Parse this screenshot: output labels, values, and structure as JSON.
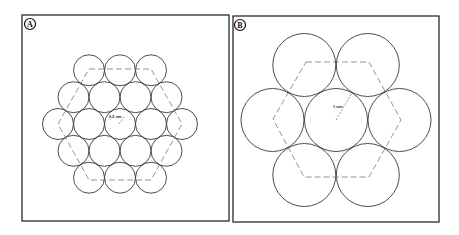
{
  "figure": {
    "panels": [
      {
        "id": "A",
        "label": "A",
        "description": "Hexagonal close packing of 19 small circles with dashed hexagon outline",
        "radius_label": "0.5 nm",
        "rows": [
          3,
          4,
          5,
          4,
          3
        ]
      },
      {
        "id": "B",
        "label": "B",
        "description": "Hexagonal arrangement of 7 large circles with dashed hexagon outline",
        "radius_label": "1 nm",
        "rows": [
          2,
          3,
          2
        ]
      }
    ]
  }
}
